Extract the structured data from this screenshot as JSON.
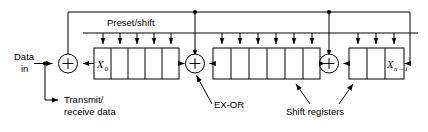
{
  "diagram": {
    "labels": {
      "preset_shift": "Preset/shift",
      "data_in_line1": "Data",
      "data_in_line2": "in",
      "transmit_line1": "Transmit/",
      "transmit_line2": "receive data",
      "exor": "EX-OR",
      "shift_registers": "Shift registers",
      "x0": "X",
      "x0_sub": "0",
      "xn": "X",
      "xn_sub": "n – 1"
    },
    "registers": [
      {
        "name": "register-bank-left",
        "cells": 5,
        "cell_labels": [
          "X0",
          "",
          "",
          "",
          ""
        ]
      },
      {
        "name": "register-bank-middle",
        "cells": 6,
        "cell_labels": [
          "",
          "",
          "",
          "",
          "",
          ""
        ]
      },
      {
        "name": "register-bank-right",
        "cells": 3,
        "cell_labels": [
          "",
          "",
          "Xn-1"
        ]
      }
    ],
    "adders": [
      {
        "name": "adder-input",
        "symbol": "+"
      },
      {
        "name": "adder-middle",
        "symbol": "+"
      },
      {
        "name": "adder-right",
        "symbol": "+"
      }
    ],
    "colors": {
      "stroke": "#000000",
      "background": "#ffffff"
    }
  }
}
